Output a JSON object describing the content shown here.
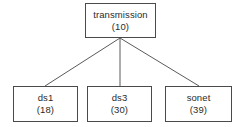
{
  "diagram": {
    "type": "tree",
    "background_color": "#ffffff",
    "border_color": "#4a4a4a",
    "text_color": "#2b2b2b",
    "edge_color": "#5a5a5a",
    "root": {
      "label": "transmission",
      "count": "(10)"
    },
    "children": [
      {
        "label": "ds1",
        "count": "(18)"
      },
      {
        "label": "ds3",
        "count": "(30)"
      },
      {
        "label": "sonet",
        "count": "(39)"
      }
    ],
    "edges": [
      {
        "from": "transmission",
        "to": "ds1"
      },
      {
        "from": "transmission",
        "to": "ds3"
      },
      {
        "from": "transmission",
        "to": "sonet"
      }
    ]
  }
}
